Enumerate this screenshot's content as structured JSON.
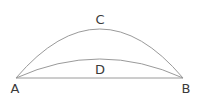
{
  "diagram": {
    "type": "geometry-arcs",
    "points": [
      {
        "id": "A",
        "label": "A",
        "x": 16,
        "y": 78
      },
      {
        "id": "B",
        "label": "B",
        "x": 183,
        "y": 78
      }
    ],
    "arcs": [
      {
        "id": "C",
        "label": "C",
        "from": "A",
        "to": "B",
        "apex_y": 29
      },
      {
        "id": "D",
        "label": "D",
        "from": "A",
        "to": "B",
        "apex_y": 59
      }
    ],
    "segments": [
      {
        "from": "A",
        "to": "B"
      }
    ],
    "stroke_color": "#9a9a9a",
    "label_color": "#3a3a3a"
  }
}
